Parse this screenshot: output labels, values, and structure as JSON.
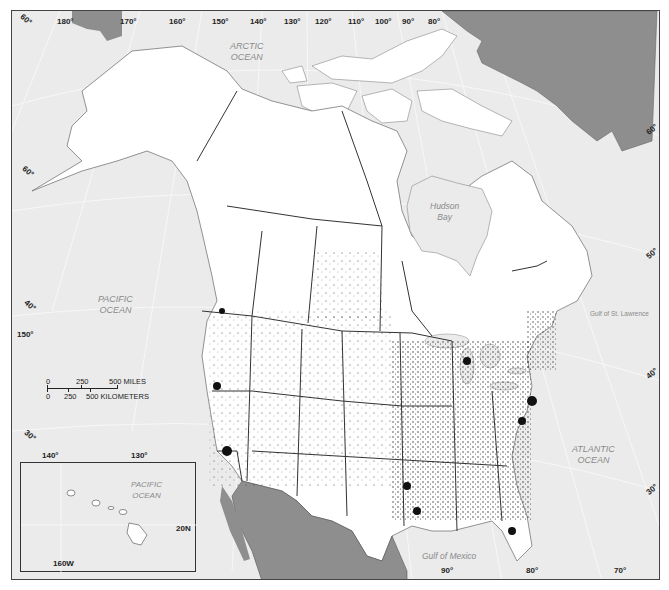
{
  "map": {
    "title": "",
    "colors": {
      "water": "#ebebeb",
      "land_us_canada": "#ffffff",
      "foreign_land": "#8e8e8e",
      "borders": "#333333",
      "coast_lines": "#888888",
      "points": "#111111",
      "graticule": "#ffffff"
    },
    "longitude_labels_top": [
      "180°",
      "170°",
      "160°",
      "150°",
      "140°",
      "130°",
      "120°",
      "110°",
      "100°",
      "90°",
      "80°"
    ],
    "longitude_labels_bottom": [
      "90°",
      "80°",
      "70°"
    ],
    "longitude_labels_side": [
      "150°",
      "140°",
      "130°"
    ],
    "latitude_labels_left": [
      "60°",
      "50°",
      "40°",
      "30°"
    ],
    "latitude_labels_right": [
      "60°",
      "50°",
      "40°",
      "30°"
    ],
    "water_labels": {
      "arctic": [
        "ARCTIC",
        "OCEAN"
      ],
      "pacific": [
        "PACIFIC",
        "OCEAN"
      ],
      "atlantic": [
        "ATLANTIC",
        "OCEAN"
      ],
      "hudson": [
        "Hudson",
        "Bay"
      ],
      "gulf_st_lawrence": "Gulf of St. Lawrence",
      "gulf_mexico": "Gulf of Mexico"
    },
    "scale_bar": {
      "miles_ticks": [
        "0",
        "250",
        "500 MILES"
      ],
      "km_ticks": [
        "0",
        "250",
        "500 KILOMETERS"
      ]
    },
    "inset": {
      "name": "Hawaii",
      "ocean_label": [
        "PACIFIC",
        "OCEAN"
      ],
      "lat_label": "20N",
      "lon_label": "160W"
    }
  }
}
